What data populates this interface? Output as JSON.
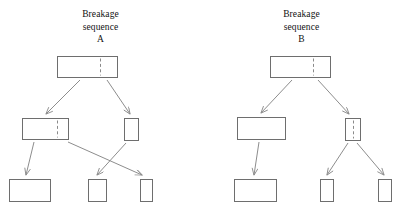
{
  "figure": {
    "background_color": "#ffffff",
    "stroke_color": "#6e6e6e",
    "arrow_color": "#8d8d8d",
    "divider_color": "#8a8a8a",
    "divider_style": "dashed"
  },
  "panels": [
    {
      "id": "a",
      "title_lines": [
        "Breakage",
        "sequence",
        "A"
      ],
      "title_label": "Breakage sequence A",
      "nodes": [
        {
          "id": "a-root",
          "name": "root-fragment",
          "x": 57,
          "y": 56,
          "w": 60,
          "h": 21,
          "divider_x": 100
        },
        {
          "id": "a-mid-left",
          "name": "mid-left-fragment",
          "x": 22,
          "y": 118,
          "w": 46,
          "h": 21,
          "divider_x": 57
        },
        {
          "id": "a-mid-right",
          "name": "mid-right-fragment",
          "x": 124,
          "y": 118,
          "w": 14,
          "h": 22,
          "divider_x": null
        },
        {
          "id": "a-leaf-1",
          "name": "bottom-left-fragment",
          "x": 9,
          "y": 179,
          "w": 41,
          "h": 22,
          "divider_x": null
        },
        {
          "id": "a-leaf-2",
          "name": "bottom-mid-fragment",
          "x": 88,
          "y": 179,
          "w": 18,
          "h": 22,
          "divider_x": null
        },
        {
          "id": "a-leaf-3",
          "name": "bottom-right-fragment",
          "x": 140,
          "y": 179,
          "w": 12,
          "h": 22,
          "divider_x": null
        }
      ],
      "links": [
        {
          "name": "link-root-to-mid-left",
          "x1": 80,
          "y1": 80,
          "x2": 46,
          "y2": 114
        },
        {
          "name": "link-root-to-mid-right",
          "x1": 107,
          "y1": 80,
          "x2": 130,
          "y2": 114
        },
        {
          "name": "link-mid-left-to-leaf-1",
          "x1": 34,
          "y1": 142,
          "x2": 26,
          "y2": 175
        },
        {
          "name": "link-mid-left-to-leaf-3",
          "x1": 68,
          "y1": 142,
          "x2": 142,
          "y2": 175
        },
        {
          "name": "link-mid-right-to-leaf-2",
          "x1": 126,
          "y1": 143,
          "x2": 97,
          "y2": 175
        }
      ]
    },
    {
      "id": "b",
      "title_lines": [
        "Breakage",
        "sequence",
        "B"
      ],
      "title_label": "Breakage sequence B",
      "nodes": [
        {
          "id": "b-root",
          "name": "root-fragment",
          "x": 69,
          "y": 56,
          "w": 60,
          "h": 21,
          "divider_x": 112
        },
        {
          "id": "b-mid-left",
          "name": "mid-left-fragment",
          "x": 36,
          "y": 117,
          "w": 48,
          "h": 22,
          "divider_x": null
        },
        {
          "id": "b-mid-right",
          "name": "mid-right-fragment",
          "x": 144,
          "y": 118,
          "w": 15,
          "h": 22,
          "divider_x": 152
        },
        {
          "id": "b-leaf-1",
          "name": "bottom-left-fragment",
          "x": 33,
          "y": 179,
          "w": 42,
          "h": 22,
          "divider_x": null
        },
        {
          "id": "b-leaf-2",
          "name": "bottom-mid-fragment",
          "x": 119,
          "y": 179,
          "w": 13,
          "h": 22,
          "divider_x": null
        },
        {
          "id": "b-leaf-3",
          "name": "bottom-right-fragment",
          "x": 177,
          "y": 179,
          "w": 13,
          "h": 22,
          "divider_x": null
        }
      ],
      "links": [
        {
          "name": "link-root-to-mid-left",
          "x1": 91,
          "y1": 80,
          "x2": 60,
          "y2": 113
        },
        {
          "name": "link-root-to-mid-right",
          "x1": 117,
          "y1": 80,
          "x2": 148,
          "y2": 114
        },
        {
          "name": "link-mid-left-to-leaf-1",
          "x1": 58,
          "y1": 142,
          "x2": 53,
          "y2": 175
        },
        {
          "name": "link-mid-right-to-leaf-2",
          "x1": 147,
          "y1": 143,
          "x2": 126,
          "y2": 175
        },
        {
          "name": "link-mid-right-to-leaf-3",
          "x1": 156,
          "y1": 143,
          "x2": 183,
          "y2": 175
        }
      ]
    }
  ]
}
